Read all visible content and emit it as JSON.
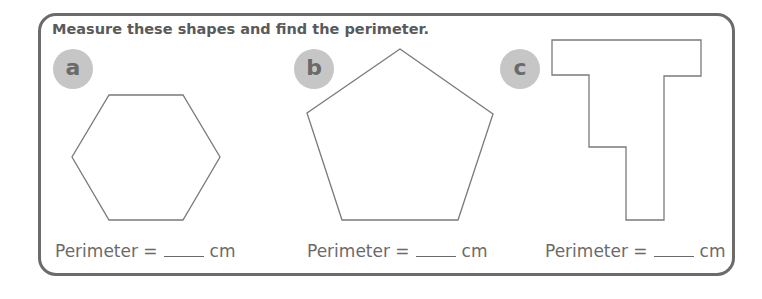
{
  "worksheet": {
    "instruction": "Measure these shapes and find the perimeter.",
    "problems": [
      {
        "label": "a",
        "shape": "hexagon",
        "answer_prefix": "Perimeter =",
        "answer_value": "",
        "answer_unit": "cm",
        "points": "109,95 183,95 220,157 183,220 109,220 72,157"
      },
      {
        "label": "b",
        "shape": "pentagon",
        "answer_prefix": "Perimeter =",
        "answer_value": "",
        "answer_unit": "cm",
        "points": "400,49 493,114 458,220 342,220 307,113"
      },
      {
        "label": "c",
        "shape": "rectilinear-t-shape",
        "answer_prefix": "Perimeter =",
        "answer_value": "",
        "answer_unit": "cm",
        "points": "552,40 701,40 701,76 664,76 664,220 626,220 626,147 589,147 589,75 552,75"
      }
    ],
    "colors": {
      "border": "#6b6b6b",
      "text": "#5a5a5a",
      "badge_fill": "#c6c6c6",
      "shape_stroke": "#7a7a7a"
    }
  }
}
